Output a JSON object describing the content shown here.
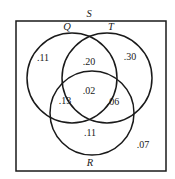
{
  "diagram": {
    "type": "venn",
    "universe": {
      "label": "S",
      "x": 16,
      "y": 21,
      "width": 150,
      "height": 150,
      "label_x": 89,
      "label_y": 17
    },
    "sets": [
      {
        "name": "Q",
        "cx": 72,
        "cy": 78,
        "r": 45,
        "label_x": 67,
        "label_y": 30
      },
      {
        "name": "T",
        "cx": 107,
        "cy": 78,
        "r": 45,
        "label_x": 111,
        "label_y": 30
      },
      {
        "name": "R",
        "cx": 92,
        "cy": 113,
        "r": 42,
        "label_x": 90,
        "label_y": 166
      }
    ],
    "regions": [
      {
        "id": "Q-only",
        "value": ".11",
        "x": 43,
        "y": 61
      },
      {
        "id": "Q-and-T-only",
        "value": ".20",
        "x": 89,
        "y": 65
      },
      {
        "id": "T-only",
        "value": ".30",
        "x": 130,
        "y": 60
      },
      {
        "id": "Q-and-T-and-R",
        "value": ".02",
        "x": 89,
        "y": 94
      },
      {
        "id": "Q-and-R-only",
        "value": ".13",
        "x": 65,
        "y": 104
      },
      {
        "id": "T-and-R-only",
        "value": ".06",
        "x": 113,
        "y": 105
      },
      {
        "id": "R-only",
        "value": ".11",
        "x": 90,
        "y": 136
      },
      {
        "id": "outside",
        "value": ".07",
        "x": 143,
        "y": 148
      }
    ],
    "colors": {
      "stroke": "#1a1a1a",
      "background": "#ffffff"
    }
  }
}
